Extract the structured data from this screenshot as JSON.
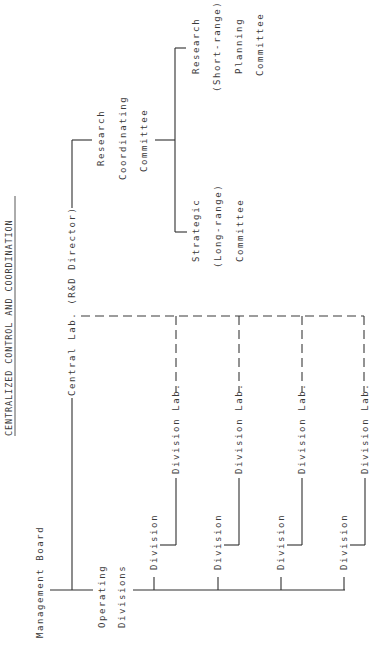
{
  "title": "CENTRALIZED CONTROL AND COORDINATION",
  "nodes": {
    "management_board": "Management Board",
    "operating_divisions": [
      "Operating",
      "Divisions"
    ],
    "central_lab": "Central Lab. (R&D Director)",
    "research_coordinating_committee": [
      "Research",
      "Coordinating",
      "Committee"
    ],
    "research_planning_committee": [
      "Research",
      "(Short-range)",
      "Planning",
      "Committee"
    ],
    "strategic_committee": [
      "Strategic",
      "(Long-range)",
      "Committee"
    ],
    "divisions": [
      {
        "division": "Division",
        "lab": "Division Lab."
      },
      {
        "division": "Division",
        "lab": "Division Lab."
      },
      {
        "division": "Division",
        "lab": "Division Lab."
      },
      {
        "division": "Division",
        "lab": "Division Lab."
      }
    ]
  },
  "colors": {
    "line": "#2e2e2e",
    "text": "#3a3a3a",
    "background": "#ffffff"
  },
  "orientation": "rotated 90deg counter-clockwise (text reads bottom-to-top)"
}
